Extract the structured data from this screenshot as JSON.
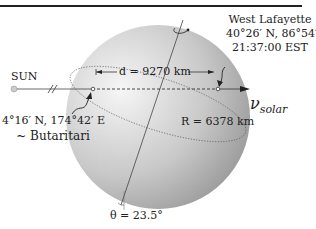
{
  "figure": {
    "sun_label": "SUN",
    "distance_label": "d = 9270 km",
    "radius_label": "R = 6378 km",
    "detector": {
      "name": "West Lafayette",
      "coords": "40°26′ N, 86°54′ W",
      "time": "21:37:00 EST"
    },
    "exit_point": {
      "coords": "4°16′ N, 174°42′ E",
      "name": "~ Butaritari"
    },
    "neutrino_label_symbol": "ν",
    "neutrino_label_sub": "solar",
    "tilt_label": "θ = 23.5°",
    "colors": {
      "sphere_light": "#f4f4f4",
      "sphere_dark": "#9a9a9a",
      "line": "#333333",
      "sun": "#bbbbbb"
    }
  }
}
